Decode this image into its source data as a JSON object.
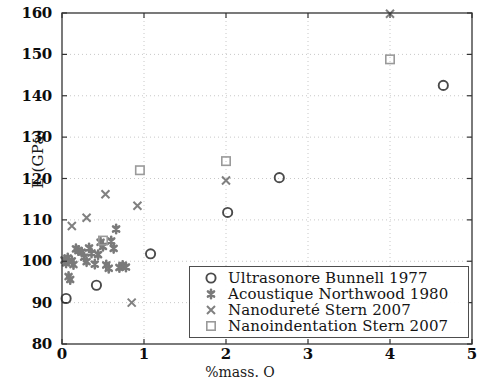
{
  "chart_data": {
    "type": "scatter",
    "title": "",
    "xlabel": "%mass. O",
    "ylabel": "E (GPa)",
    "xlim": [
      0,
      5
    ],
    "ylim": [
      80,
      160
    ],
    "xticks": [
      0,
      1,
      2,
      3,
      4,
      5
    ],
    "yticks": [
      80,
      90,
      100,
      110,
      120,
      130,
      140,
      150,
      160
    ],
    "xtick_labels": [
      "0",
      "1",
      "2",
      "3",
      "4",
      "5"
    ],
    "ytick_labels": [
      "80",
      "90",
      "100",
      "110",
      "120",
      "130",
      "140",
      "150",
      "160"
    ],
    "grid": true,
    "grid_style": "dotted",
    "grid_color": "#c8c8c8",
    "legend_position": "lower right",
    "marker_color": "#4d4d4d",
    "axis_color": "#333333",
    "series": [
      {
        "name": "Ultrasonore Bunnell 1977",
        "marker": "circle",
        "color": "#4a4a4a",
        "points": [
          [
            0.05,
            91.0
          ],
          [
            0.42,
            94.2
          ],
          [
            1.08,
            101.8
          ],
          [
            2.02,
            111.8
          ],
          [
            2.65,
            120.2
          ],
          [
            4.65,
            142.5
          ]
        ]
      },
      {
        "name": "Acoustique Northwood 1980",
        "marker": "asterisk",
        "color": "#7a7a7a",
        "points": [
          [
            0.03,
            100.3
          ],
          [
            0.05,
            99.6
          ],
          [
            0.07,
            100.8
          ],
          [
            0.08,
            96.3
          ],
          [
            0.1,
            95.6
          ],
          [
            0.12,
            100.1
          ],
          [
            0.14,
            99.2
          ],
          [
            0.17,
            103.0
          ],
          [
            0.2,
            102.6
          ],
          [
            0.24,
            102.2
          ],
          [
            0.27,
            101.0
          ],
          [
            0.3,
            99.9
          ],
          [
            0.33,
            103.2
          ],
          [
            0.36,
            102.0
          ],
          [
            0.4,
            99.3
          ],
          [
            0.44,
            101.6
          ],
          [
            0.47,
            104.6
          ],
          [
            0.5,
            103.6
          ],
          [
            0.54,
            99.1
          ],
          [
            0.57,
            98.3
          ],
          [
            0.6,
            104.9
          ],
          [
            0.63,
            103.1
          ],
          [
            0.66,
            107.8
          ],
          [
            0.7,
            98.5
          ],
          [
            0.74,
            99.0
          ],
          [
            0.78,
            98.6
          ]
        ]
      },
      {
        "name": "Nanodureté Stern 2007",
        "marker": "x",
        "color": "#808080",
        "points": [
          [
            0.12,
            108.5
          ],
          [
            0.3,
            110.5
          ],
          [
            0.53,
            116.2
          ],
          [
            0.85,
            90.0
          ],
          [
            0.92,
            113.4
          ],
          [
            2.0,
            119.5
          ],
          [
            4.0,
            159.8
          ]
        ]
      },
      {
        "name": "Nanoindentation Stern 2007",
        "marker": "square",
        "color": "#9a9a9a",
        "points": [
          [
            0.5,
            105.0
          ],
          [
            0.95,
            122.0
          ],
          [
            2.0,
            124.2
          ],
          [
            4.0,
            148.8
          ]
        ]
      }
    ]
  },
  "legend": {
    "entries": [
      {
        "label": "Ultrasonore Bunnell 1977",
        "marker": "circle"
      },
      {
        "label": "Acoustique Northwood 1980",
        "marker": "asterisk"
      },
      {
        "label": "Nanodureté Stern 2007",
        "marker": "x"
      },
      {
        "label": "Nanoindentation Stern 2007",
        "marker": "square"
      }
    ]
  }
}
